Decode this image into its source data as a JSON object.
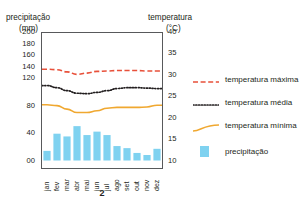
{
  "axis_titles": {
    "left_line1": "precipitação",
    "left_line2": "(mm)",
    "right_line1": "temperatura",
    "right_line2": "(°C)"
  },
  "caption": "2",
  "colors": {
    "precipitation_bar": "#7fd2f0",
    "temp_max": "#e8503a",
    "temp_mean": "#231f20",
    "temp_min": "#f0a830",
    "frame": "#58595b"
  },
  "legend": {
    "items": [
      {
        "label": "temperatura máxima",
        "symbol": "dashed-red-line",
        "color": "#e8503a"
      },
      {
        "label": "temperatura média",
        "symbol": "dotted-black-line",
        "color": "#231f20"
      },
      {
        "label": "temperatura mínima",
        "symbol": "solid-orange-line",
        "color": "#f0a830"
      },
      {
        "label": "precipitação",
        "symbol": "blue-square-swatch",
        "color": "#7fd2f0"
      }
    ]
  },
  "chart_data": {
    "type": "bar",
    "title": "",
    "subtitle": "",
    "xlabel": "",
    "ylabel": "precipitação (mm)",
    "y2label": "temperatura (°C)",
    "grid": false,
    "legend_position": "right",
    "categories": [
      "jan",
      "fev",
      "mar",
      "abr",
      "mai",
      "jun",
      "jul",
      "ago",
      "set",
      "out",
      "nov",
      "dez"
    ],
    "left_axis": {
      "label": "precipitação (mm)",
      "unit": "mm",
      "tick_labels": [
        "00",
        "40",
        "80",
        "120",
        "140",
        "160",
        "180",
        "200"
      ],
      "tick_values": [
        0,
        40,
        80,
        120,
        140,
        160,
        180,
        200
      ],
      "note": "non-linear: spacing compresses above 120 mm",
      "ylim": [
        0,
        200
      ]
    },
    "right_axis": {
      "label": "temperatura (°C)",
      "unit": "°C",
      "tick_labels": [
        "10",
        "15",
        "20",
        "25",
        "30",
        "35",
        "40"
      ],
      "tick_values": [
        10,
        15,
        20,
        25,
        30,
        35,
        40
      ],
      "ylim": [
        10,
        40
      ]
    },
    "series": [
      {
        "name": "precipitação",
        "type": "bar",
        "axis": "left",
        "unit": "mm",
        "color": "#7fd2f0",
        "values": [
          14,
          39,
          35,
          50,
          37,
          42,
          37,
          21,
          18,
          11,
          8,
          17
        ]
      },
      {
        "name": "temperatura máxima",
        "type": "line",
        "style": "dashed",
        "axis": "right",
        "unit": "°C",
        "color": "#e8503a",
        "values": [
          31.3,
          31.2,
          30.7,
          30.1,
          30.4,
          30.8,
          30.9,
          31.0,
          31.0,
          31.0,
          30.9,
          30.9
        ]
      },
      {
        "name": "temperatura média",
        "type": "line",
        "style": "dotted",
        "axis": "right",
        "unit": "°C",
        "color": "#231f20",
        "values": [
          27.5,
          27.0,
          26.3,
          25.7,
          25.6,
          25.9,
          26.3,
          26.8,
          27.0,
          27.0,
          26.9,
          26.8
        ]
      },
      {
        "name": "temperatura mínima",
        "type": "line",
        "style": "solid",
        "axis": "right",
        "unit": "°C",
        "color": "#f0a830",
        "values": [
          23.0,
          22.8,
          22.0,
          21.2,
          21.2,
          21.6,
          22.2,
          22.4,
          22.4,
          22.4,
          22.5,
          22.9
        ]
      }
    ]
  }
}
